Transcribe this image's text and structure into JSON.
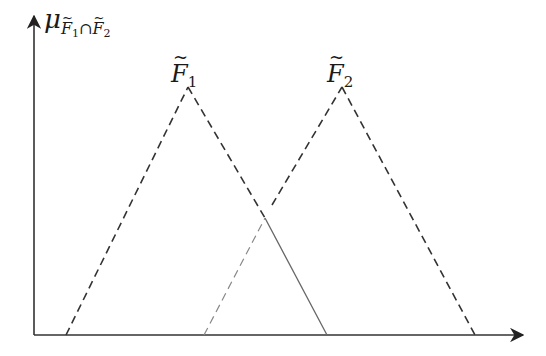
{
  "diagram": {
    "type": "fuzzy-membership-intersection",
    "y_axis_label": {
      "symbol": "μ",
      "subscript_a": "F",
      "subscript_a_index": "1",
      "operator": "∩",
      "subscript_b": "F",
      "subscript_b_index": "2"
    },
    "sets": [
      {
        "name": "F",
        "index": "1",
        "label_pos": [
          170,
          60
        ],
        "base_left": [
          66,
          335
        ],
        "apex": [
          188,
          87
        ],
        "base_right": [
          327,
          335
        ]
      },
      {
        "name": "F",
        "index": "2",
        "label_pos": [
          326,
          60
        ],
        "base_left": [
          196,
          335
        ],
        "apex": [
          342,
          87
        ],
        "base_right": [
          475,
          335
        ]
      }
    ],
    "intersection_point": [
      265,
      218
    ],
    "intersection_region": "solid lower envelope: F2 left edge (dashed light) up to crossing, F1 right edge (solid) down to base",
    "axes": {
      "origin": [
        34,
        335
      ],
      "x_end": [
        525,
        335
      ],
      "y_end": [
        34,
        14
      ]
    },
    "colors": {
      "axis": "#333333",
      "dashed": "#333333",
      "solid": "#555555",
      "light_dashed": "#777777"
    }
  }
}
